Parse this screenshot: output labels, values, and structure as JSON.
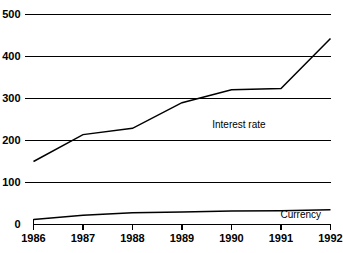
{
  "chart_data": {
    "type": "line",
    "title": "",
    "subtitle": "",
    "xlabel": "",
    "ylabel": "",
    "x": [
      1986,
      1987,
      1988,
      1989,
      1990,
      1991,
      1992
    ],
    "categories": [
      "1986",
      "1987",
      "1988",
      "1989",
      "1990",
      "1991",
      "1992"
    ],
    "series": [
      {
        "name": "Interest rate",
        "values": [
          150,
          214,
          229,
          290,
          321,
          324,
          443
        ],
        "color": "#000000",
        "label_x": 1990.15,
        "label_y": 237
      },
      {
        "name": "Currency",
        "values": [
          12,
          22,
          28,
          30,
          32,
          33,
          35
        ],
        "color": "#000000",
        "label_x": 1991.4,
        "label_y": 22
      }
    ],
    "xlim": [
      1986,
      1992
    ],
    "ylim": [
      0,
      500
    ],
    "yticks": [
      0,
      100,
      200,
      300,
      400,
      500
    ],
    "ytick_labels": [
      "0",
      "100",
      "200",
      "300",
      "400",
      "500"
    ],
    "xticks": [
      1986,
      1987,
      1988,
      1989,
      1990,
      1991,
      1992
    ],
    "xtick_labels": [
      "1986",
      "1987",
      "1988",
      "1989",
      "1990",
      "1991",
      "1992"
    ],
    "grid": true,
    "grid_axis": "y",
    "legend": "inline-annotations",
    "legend_position": "on-plot",
    "background": "#ffffff",
    "foreground": "#000000"
  }
}
